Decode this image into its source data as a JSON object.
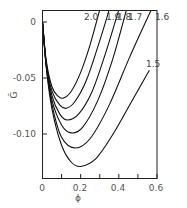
{
  "chart_data": {
    "type": "line",
    "title": "",
    "xlabel": "ϕ",
    "ylabel": "G̃",
    "xlim": [
      0,
      0.6
    ],
    "ylim": [
      -0.14,
      0.011
    ],
    "grid": false,
    "legend": "inline labels at curve ends",
    "xticks": [
      0,
      0.1,
      0.2,
      0.3,
      0.4,
      0.5,
      0.6
    ],
    "xtick_labels": [
      "0",
      "",
      "0.2",
      "",
      "0.4",
      "",
      "0.6"
    ],
    "yticks": [
      0,
      -0.05,
      -0.1
    ],
    "ytick_labels": [
      "0",
      "-0.05",
      "-0.10"
    ],
    "series": [
      {
        "name": "2.0",
        "x": [
          0,
          0.02,
          0.05,
          0.08,
          0.107,
          0.15,
          0.2,
          0.25,
          0.3
        ],
        "y": [
          0,
          -0.035,
          -0.058,
          -0.066,
          -0.068,
          -0.062,
          -0.045,
          -0.02,
          0.011
        ]
      },
      {
        "name": "1.9",
        "x": [
          0,
          0.02,
          0.05,
          0.09,
          0.125,
          0.17,
          0.23,
          0.29,
          0.35
        ],
        "y": [
          0,
          -0.037,
          -0.062,
          -0.074,
          -0.077,
          -0.071,
          -0.052,
          -0.022,
          0.011
        ]
      },
      {
        "name": "1.8",
        "x": [
          0,
          0.02,
          0.05,
          0.09,
          0.13,
          0.19,
          0.26,
          0.33,
          0.4
        ],
        "y": [
          0,
          -0.038,
          -0.066,
          -0.082,
          -0.0875,
          -0.082,
          -0.062,
          -0.028,
          0.011
        ]
      },
      {
        "name": "1.7",
        "x": [
          0,
          0.02,
          0.05,
          0.1,
          0.15,
          0.21,
          0.29,
          0.37,
          0.44
        ],
        "y": [
          0,
          -0.039,
          -0.07,
          -0.092,
          -0.099,
          -0.094,
          -0.07,
          -0.032,
          0.011
        ]
      },
      {
        "name": "1.6",
        "x": [
          0,
          0.02,
          0.05,
          0.1,
          0.17,
          0.25,
          0.35,
          0.46,
          0.57
        ],
        "y": [
          0,
          -0.04,
          -0.074,
          -0.103,
          -0.1125,
          -0.104,
          -0.074,
          -0.03,
          0.011
        ]
      },
      {
        "name": "1.5",
        "x": [
          0,
          0.02,
          0.05,
          0.1,
          0.15,
          0.2,
          0.28,
          0.37,
          0.47,
          0.56
        ],
        "y": [
          0,
          -0.041,
          -0.078,
          -0.11,
          -0.125,
          -0.129,
          -0.122,
          -0.1,
          -0.07,
          -0.043
        ]
      }
    ],
    "annotations": [
      {
        "text": "2.0",
        "x": 0.26,
        "y": 0.005
      },
      {
        "text": "1.9",
        "x": 0.31,
        "y": 0.005
      },
      {
        "text": "1.8",
        "x": 0.36,
        "y": 0.005
      },
      {
        "text": "1.7",
        "x": 0.42,
        "y": 0.005
      },
      {
        "text": "1.6",
        "x": 0.52,
        "y": 0.005
      },
      {
        "text": "1.5",
        "x": 0.54,
        "y": -0.036
      }
    ]
  },
  "axes": {
    "x_title": "ϕ",
    "y_title": "G̃",
    "x_tick_labels": [
      "0",
      "0.2",
      "0.4",
      "0.6"
    ],
    "y_tick_labels": [
      "0",
      "-0.05",
      "-0.10"
    ]
  },
  "curve_labels": [
    "2.0",
    "1.9",
    "1.8",
    "1.7",
    "1.6",
    "1.5"
  ]
}
